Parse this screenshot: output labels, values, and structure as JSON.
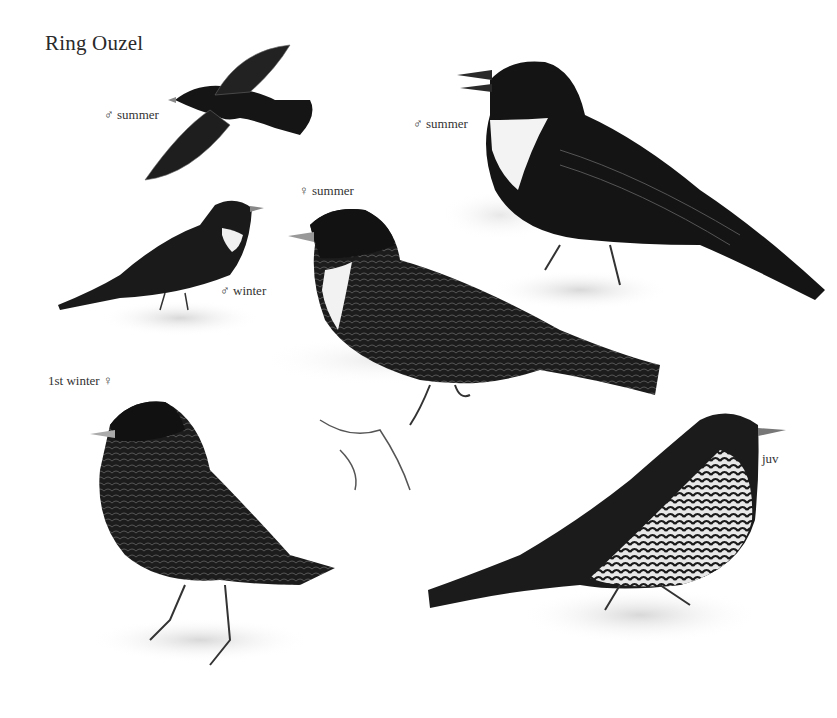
{
  "plate": {
    "title": "Ring Ouzel",
    "labels": [
      {
        "id": "male-summer-flight",
        "text": "♂ summer"
      },
      {
        "id": "male-summer-large",
        "text": "♂ summer"
      },
      {
        "id": "female-summer",
        "text": "♀ summer"
      },
      {
        "id": "male-winter",
        "text": "♂ winter"
      },
      {
        "id": "first-winter-female",
        "text": "1st winter ♀"
      },
      {
        "id": "juvenile",
        "text": "juv"
      }
    ]
  },
  "colors": {
    "background": "#ffffff",
    "bird_dark": "#141414",
    "bird_mid": "#2e2e2e",
    "bib": "#f2f2f2",
    "ground": "#dcdcdc"
  }
}
